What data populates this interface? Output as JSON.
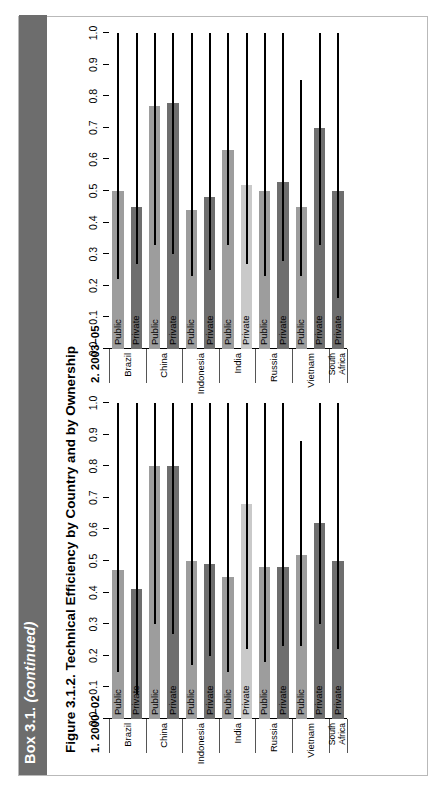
{
  "box": {
    "label": "Box 3.1.",
    "continued": "(continued)",
    "bar_color": "#6d6d6d"
  },
  "figure": {
    "title": "Figure 3.1.2. Technical Efficiency by Country and by Ownership"
  },
  "chart_data": {
    "type": "bar",
    "title": "Figure 3.1.2. Technical Efficiency by Country and by Ownership",
    "orientation": "horizontal",
    "xlabel": "",
    "ylabel": "",
    "ylim": [
      0.0,
      1.0
    ],
    "grid": false,
    "legend": "none",
    "tick_labels": [
      "0.0",
      "0.1",
      "0.2",
      "0.3",
      "0.4",
      "0.5",
      "0.6",
      "0.7",
      "0.8",
      "0.9",
      "1.0"
    ],
    "tick_values": [
      0.0,
      0.1,
      0.2,
      0.3,
      0.4,
      0.5,
      0.6,
      0.7,
      0.8,
      0.9,
      1.0
    ],
    "colors": {
      "public": "#9d9d9d",
      "public_light": "#c6c6c6",
      "private": "#6e6e6e",
      "private_light": "#c9c9c9",
      "line": "#000000"
    },
    "panels": [
      {
        "id": "panel1",
        "label": "1. 2000–02",
        "countries": [
          {
            "name": "Brazil",
            "bars": [
              {
                "ownership": "Public",
                "value": 0.47,
                "line_end": 1.0,
                "line_start": 0.15,
                "shade": "public"
              },
              {
                "ownership": "Private",
                "value": 0.41,
                "line_end": 1.0,
                "line_start": 0.08,
                "shade": "private"
              }
            ]
          },
          {
            "name": "China",
            "bars": [
              {
                "ownership": "Public",
                "value": 0.8,
                "line_end": 1.0,
                "line_start": 0.3,
                "shade": "public"
              },
              {
                "ownership": "Private",
                "value": 0.8,
                "line_end": 1.0,
                "line_start": 0.27,
                "shade": "private"
              }
            ]
          },
          {
            "name": "Indonesia",
            "bars": [
              {
                "ownership": "Public",
                "value": 0.5,
                "line_end": 1.0,
                "line_start": 0.17,
                "shade": "public"
              },
              {
                "ownership": "Private",
                "value": 0.49,
                "line_end": 1.0,
                "line_start": 0.2,
                "shade": "private"
              }
            ]
          },
          {
            "name": "India",
            "bars": [
              {
                "ownership": "Public",
                "value": 0.45,
                "line_end": 1.0,
                "line_start": 0.15,
                "shade": "public"
              },
              {
                "ownership": "Private",
                "value": 0.68,
                "line_end": 1.0,
                "line_start": 0.22,
                "shade": "private_light"
              }
            ]
          },
          {
            "name": "Russia",
            "bars": [
              {
                "ownership": "Public",
                "value": 0.48,
                "line_end": 1.0,
                "line_start": 0.18,
                "shade": "public"
              },
              {
                "ownership": "Private",
                "value": 0.48,
                "line_end": 1.0,
                "line_start": 0.23,
                "shade": "private"
              }
            ]
          },
          {
            "name": "Vietnam",
            "bars": [
              {
                "ownership": "Public",
                "value": 0.52,
                "line_end": 0.88,
                "line_start": 0.23,
                "shade": "public"
              },
              {
                "ownership": "Private",
                "value": 0.62,
                "line_end": 1.0,
                "line_start": 0.3,
                "shade": "private"
              }
            ]
          },
          {
            "name": "South Africa",
            "bars": [
              {
                "ownership": "Private",
                "value": 0.5,
                "line_end": 1.0,
                "line_start": 0.22,
                "shade": "private"
              }
            ]
          }
        ]
      },
      {
        "id": "panel2",
        "label": "2. 2003–05",
        "countries": [
          {
            "name": "Brazil",
            "bars": [
              {
                "ownership": "Public",
                "value": 0.5,
                "line_end": 1.0,
                "line_start": 0.22,
                "shade": "public"
              },
              {
                "ownership": "Private",
                "value": 0.45,
                "line_end": 1.0,
                "line_start": 0.27,
                "shade": "private"
              }
            ]
          },
          {
            "name": "China",
            "bars": [
              {
                "ownership": "Public",
                "value": 0.77,
                "line_end": 1.0,
                "line_start": 0.33,
                "shade": "public"
              },
              {
                "ownership": "Private",
                "value": 0.78,
                "line_end": 1.0,
                "line_start": 0.3,
                "shade": "private"
              }
            ]
          },
          {
            "name": "Indonesia",
            "bars": [
              {
                "ownership": "Public",
                "value": 0.44,
                "line_end": 1.0,
                "line_start": 0.23,
                "shade": "public"
              },
              {
                "ownership": "Private",
                "value": 0.48,
                "line_end": 1.0,
                "line_start": 0.25,
                "shade": "private"
              }
            ]
          },
          {
            "name": "India",
            "bars": [
              {
                "ownership": "Public",
                "value": 0.63,
                "line_end": 1.0,
                "line_start": 0.33,
                "shade": "public"
              },
              {
                "ownership": "Private",
                "value": 0.52,
                "line_end": 1.0,
                "line_start": 0.27,
                "shade": "private_light"
              }
            ]
          },
          {
            "name": "Russia",
            "bars": [
              {
                "ownership": "Public",
                "value": 0.5,
                "line_end": 1.0,
                "line_start": 0.23,
                "shade": "public"
              },
              {
                "ownership": "Private",
                "value": 0.53,
                "line_end": 1.0,
                "line_start": 0.28,
                "shade": "private"
              }
            ]
          },
          {
            "name": "Vietnam",
            "bars": [
              {
                "ownership": "Public",
                "value": 0.45,
                "line_end": 0.85,
                "line_start": 0.23,
                "shade": "public"
              },
              {
                "ownership": "Private",
                "value": 0.7,
                "line_end": 1.0,
                "line_start": 0.33,
                "shade": "private"
              }
            ]
          },
          {
            "name": "South Africa",
            "bars": [
              {
                "ownership": "Private",
                "value": 0.5,
                "line_end": 1.0,
                "line_start": 0.16,
                "shade": "private"
              }
            ]
          }
        ]
      }
    ]
  }
}
